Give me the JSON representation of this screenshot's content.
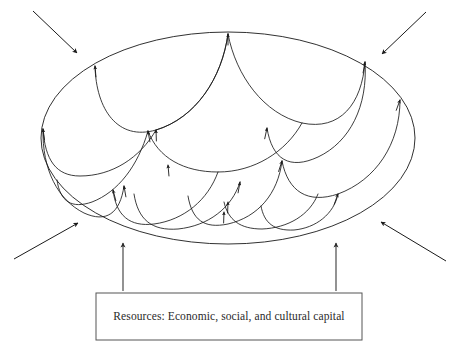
{
  "diagram": {
    "type": "conceptual-diagram",
    "canvas": {
      "width": 458,
      "height": 356
    },
    "colors": {
      "stroke": "#1a1a1a",
      "box_stroke": "#555555",
      "background": "#ffffff",
      "text": "#2a2a2a"
    },
    "container": {
      "shape": "ellipse",
      "cx": 228,
      "cy": 138,
      "rx": 187,
      "ry": 106,
      "label": ""
    },
    "resource_box": {
      "text": "Resources: Economic, social, and cultural capital",
      "x": 96,
      "y": 293,
      "width": 266,
      "height": 47
    },
    "feed_arrows": [
      {
        "name": "left-feed-arrow",
        "x1": 123,
        "y1": 291,
        "x2": 123,
        "y2": 243
      },
      {
        "name": "right-feed-arrow",
        "x1": 336,
        "y1": 291,
        "x2": 336,
        "y2": 243
      }
    ],
    "external_arrows": [
      {
        "name": "top-left-external-arrow",
        "x1": 33,
        "y1": 11,
        "x2": 77,
        "y2": 53
      },
      {
        "name": "top-right-external-arrow",
        "x1": 426,
        "y1": 12,
        "x2": 382,
        "y2": 54
      },
      {
        "name": "bottom-left-external-arrow",
        "x1": 14,
        "y1": 259,
        "x2": 78,
        "y2": 223
      },
      {
        "name": "bottom-right-external-arrow",
        "x1": 446,
        "y1": 261,
        "x2": 381,
        "y2": 222
      }
    ],
    "scale_arcs": [
      {
        "name": "scale-arc-top-left",
        "d": "M 228 34 C 222 78 196 118 156 130 C 118 141 96 110 95 66"
      },
      {
        "name": "scale-arc-top-right",
        "d": "M 228 34 C 236 76 264 114 302 123 C 340 131 362 104 365 62"
      },
      {
        "name": "scale-arc-upper-far-left",
        "d": "M 156 130 C 140 158 112 176 80 176 C 56 176 45 160 43 129"
      },
      {
        "name": "scale-arc-upper-mid",
        "d": "M 228 34 C 222 78 196 118 156 130"
      },
      {
        "name": "scale-arc-mid-left",
        "d": "M 302 123 C 286 152 254 172 218 172 C 184 172 158 158 148 131"
      },
      {
        "name": "scale-arc-mid-right",
        "d": "M 365 62 C 368 106 350 142 318 157 C 290 170 272 160 267 128"
      },
      {
        "name": "scale-arc-right-outer",
        "d": "M 400 100 C 400 144 376 180 338 194 C 308 204 288 192 282 161"
      },
      {
        "name": "scale-arc-lower-left-outer",
        "d": "M 43 129 C 42 170 58 200 84 213 C 106 223 120 214 124 186"
      },
      {
        "name": "scale-arc-lower-left-inner",
        "d": "M 148 131 C 138 166 118 192 92 202 C 72 209 60 202 57 180"
      },
      {
        "name": "scale-arc-bottom-left",
        "d": "M 218 172 C 208 200 184 220 154 224 C 130 227 116 216 113 190"
      },
      {
        "name": "scale-arc-bottom-mid",
        "d": "M 240 182 C 232 208 208 226 178 229 C 152 231 138 220 134 194"
      },
      {
        "name": "scale-arc-bottom-right",
        "d": "M 282 161 C 278 194 258 217 228 224 C 204 229 192 220 188 196"
      },
      {
        "name": "scale-arc-bottom-right-inner",
        "d": "M 318 194 C 310 215 288 228 262 229 C 240 229 228 220 224 202"
      },
      {
        "name": "scale-arc-right-lower",
        "d": "M 338 194 C 334 214 316 228 294 230 C 274 231 264 223 261 206"
      }
    ],
    "arrow_tips": [
      {
        "name": "arrow-tip-top-center",
        "x": 228,
        "y": 34,
        "angle": -90
      },
      {
        "name": "arrow-tip-upper-left",
        "x": 95,
        "y": 66,
        "angle": -95
      },
      {
        "name": "arrow-tip-upper-right",
        "x": 365,
        "y": 62,
        "angle": -80
      },
      {
        "name": "arrow-tip-left-edge",
        "x": 43,
        "y": 129,
        "angle": -98
      },
      {
        "name": "arrow-tip-right-edge",
        "x": 400,
        "y": 100,
        "angle": -70
      },
      {
        "name": "arrow-tip-mid-left",
        "x": 148,
        "y": 131,
        "angle": -100
      },
      {
        "name": "arrow-tip-mid-right",
        "x": 267,
        "y": 128,
        "angle": -78
      },
      {
        "name": "arrow-tip-mid-center",
        "x": 156,
        "y": 130,
        "angle": -92
      },
      {
        "name": "arrow-tip-center-low",
        "x": 168,
        "y": 165,
        "angle": -95
      },
      {
        "name": "arrow-tip-lower-center",
        "x": 240,
        "y": 182,
        "angle": -80
      },
      {
        "name": "arrow-tip-lower-left",
        "x": 124,
        "y": 186,
        "angle": -100
      },
      {
        "name": "arrow-tip-lower-left-2",
        "x": 113,
        "y": 190,
        "angle": -105
      },
      {
        "name": "arrow-tip-lower-right",
        "x": 282,
        "y": 161,
        "angle": -72
      },
      {
        "name": "arrow-tip-bottom-center",
        "x": 228,
        "y": 202,
        "angle": -88
      },
      {
        "name": "arrow-tip-bottom-center-2",
        "x": 224,
        "y": 212,
        "angle": -88
      },
      {
        "name": "arrow-tip-right-low",
        "x": 338,
        "y": 194,
        "angle": -70
      }
    ]
  }
}
